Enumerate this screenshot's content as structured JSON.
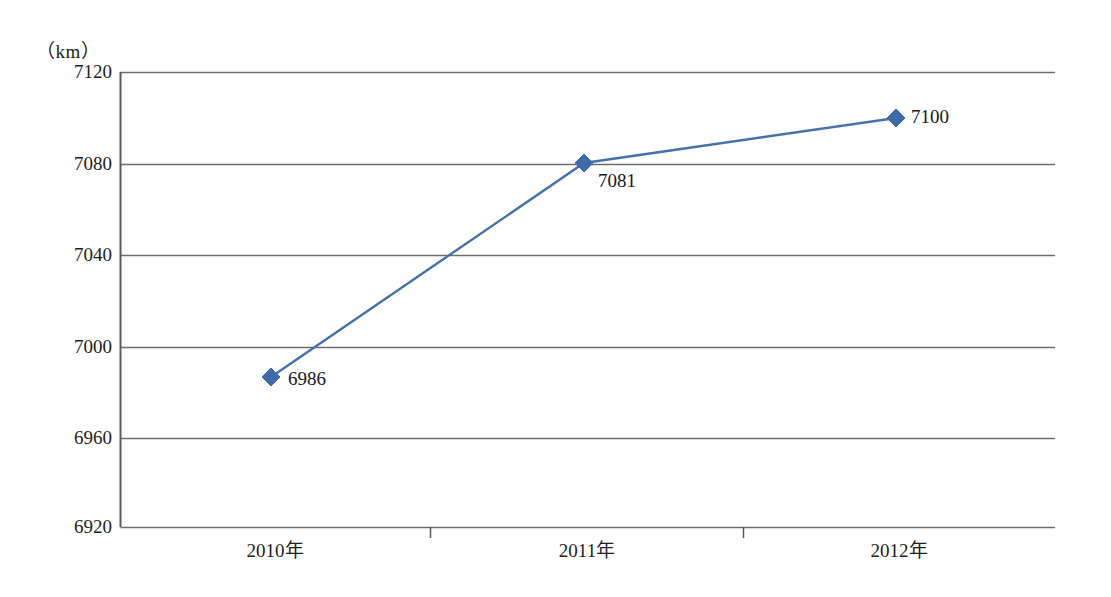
{
  "chart_data": {
    "type": "line",
    "title": "",
    "subtitle": "",
    "unit_label": "（km）",
    "xlabel": "",
    "ylabel": "",
    "categories": [
      "2010年",
      "2011年",
      "2012年"
    ],
    "values": [
      6986,
      7081,
      7100
    ],
    "point_labels": [
      "6986",
      "7081",
      "7100"
    ],
    "series": [
      {
        "name": "里程",
        "values": [
          6986,
          7081,
          7100
        ]
      }
    ],
    "ylim": [
      6920,
      7120
    ],
    "ytick_labels": [
      "7120",
      "7080",
      "7040",
      "7000",
      "6960",
      "6920"
    ],
    "ytick_values": [
      7120,
      7080,
      7040,
      7000,
      6960,
      6920
    ],
    "ystep": 40,
    "grid": true,
    "grid_axis": "y",
    "legend": false,
    "legend_position": "none",
    "marker": "diamond",
    "colors": {
      "line": "#4472a8",
      "marker": "#3f6ca8",
      "grid": "#6d6d6d",
      "axis": "#555555",
      "text": "#1d1d1d",
      "background": "#ffffff"
    }
  },
  "axes": {
    "y_ticks": [
      {
        "label": "7120",
        "value": 7120,
        "y": 72
      },
      {
        "label": "7080",
        "value": 7080,
        "y": 164
      },
      {
        "label": "7040",
        "value": 7040,
        "y": 255
      },
      {
        "label": "7000",
        "value": 7000,
        "y": 347
      },
      {
        "label": "6960",
        "value": 6960,
        "y": 438
      },
      {
        "label": "6920",
        "value": 6920,
        "y": 527
      }
    ],
    "x_ticks": [
      {
        "label": "2010年",
        "x": 275
      },
      {
        "label": "2011年",
        "x": 587
      },
      {
        "label": "2012年",
        "x": 899
      }
    ]
  },
  "points": [
    {
      "label": "6986",
      "value": 6986,
      "cx": 271,
      "cy": 377,
      "label_x": 288,
      "label_y": 368
    },
    {
      "label": "7081",
      "value": 7081,
      "cx": 584,
      "cy": 163,
      "label_x": 598,
      "label_y": 170
    },
    {
      "label": "7100",
      "value": 7100,
      "cx": 896,
      "cy": 118,
      "label_x": 911,
      "label_y": 106
    }
  ]
}
